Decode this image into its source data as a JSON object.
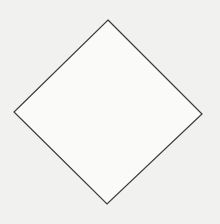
{
  "canvas": {
    "width": 220,
    "height": 224,
    "background_color": "#f1f1ef",
    "description": "diamond outline figure"
  },
  "figure": {
    "name": "diamond",
    "shape_type": "quadrilateral",
    "label": "diamond",
    "fill_color": "#fafaf8",
    "stroke_color": "#3a3a3c",
    "stroke_width": 1.2,
    "vertices": [
      {
        "name": "top",
        "x": 108,
        "y": 20
      },
      {
        "name": "right",
        "x": 202,
        "y": 114
      },
      {
        "name": "bottom",
        "x": 107,
        "y": 204
      },
      {
        "name": "left",
        "x": 14,
        "y": 112
      }
    ],
    "points_attr": "108,20 202,114 107,204 14,112"
  }
}
